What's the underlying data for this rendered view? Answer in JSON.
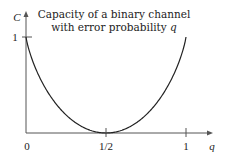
{
  "chart_data": {
    "type": "line",
    "title": "Capacity of a binary channel with error probability q",
    "title_lines": [
      "Capacity of a binary channel",
      "with error probability q"
    ],
    "xlabel": "q",
    "ylabel": "C",
    "xlim": [
      0,
      1
    ],
    "ylim": [
      0,
      1
    ],
    "x_ticks": [
      {
        "value": 0,
        "label": "0"
      },
      {
        "value": 0.5,
        "label": "1/2"
      },
      {
        "value": 1,
        "label": "1"
      }
    ],
    "y_ticks": [
      {
        "value": 1,
        "label": "1"
      }
    ],
    "grid": false,
    "legend": null,
    "series": [
      {
        "name": "C(q) = 1 - H(q)",
        "x": [
          0,
          0.05,
          0.1,
          0.15,
          0.2,
          0.25,
          0.3,
          0.35,
          0.4,
          0.45,
          0.5,
          0.55,
          0.6,
          0.65,
          0.7,
          0.75,
          0.8,
          0.85,
          0.9,
          0.95,
          1
        ],
        "y": [
          1,
          0.714,
          0.531,
          0.39,
          0.278,
          0.189,
          0.119,
          0.066,
          0.029,
          0.007,
          0,
          0.007,
          0.029,
          0.066,
          0.119,
          0.189,
          0.278,
          0.39,
          0.531,
          0.714,
          1
        ]
      }
    ],
    "color": "#222222"
  }
}
